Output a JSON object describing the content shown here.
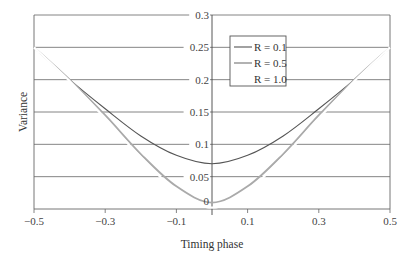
{
  "chart_data": {
    "type": "line",
    "title": "",
    "xlabel": "Timing phase",
    "ylabel": "Variance",
    "xlim": [
      -0.5,
      0.5
    ],
    "ylim": [
      0,
      0.3
    ],
    "x_ticks": [
      -0.5,
      -0.3,
      -0.1,
      0.1,
      0.3,
      0.5
    ],
    "x_tick_labels": [
      "−0.5",
      "−0.3",
      "−0.1",
      "0.1",
      "0.3",
      "0.5"
    ],
    "y_ticks": [
      0,
      0.05,
      0.1,
      0.15,
      0.2,
      0.25,
      0.3
    ],
    "y_tick_labels": [
      "0",
      "0.05",
      "0.1",
      "0.15",
      "0.2",
      "0.25",
      "0.3"
    ],
    "grid": {
      "horizontal": true,
      "vertical": false
    },
    "legend_position": "upper center-right (inside plot)",
    "x": [
      -0.5,
      -0.4,
      -0.3,
      -0.2,
      -0.1,
      0.0,
      0.1,
      0.2,
      0.3,
      0.4,
      0.5
    ],
    "series": [
      {
        "name": "R = 0.1",
        "color": "#555555",
        "values": [
          0.25,
          0.2,
          0.155,
          0.113,
          0.083,
          0.07,
          0.083,
          0.113,
          0.155,
          0.2,
          0.25
        ]
      },
      {
        "name": "R = 0.5",
        "color": "#aaaaaa",
        "values": [
          0.25,
          0.2,
          0.145,
          0.085,
          0.035,
          0.01,
          0.035,
          0.085,
          0.145,
          0.2,
          0.25
        ]
      },
      {
        "name": "R = 1.0",
        "color": "#ffffff",
        "values": [
          0.25,
          0.198,
          0.14,
          0.08,
          0.028,
          0.002,
          0.028,
          0.08,
          0.14,
          0.198,
          0.25
        ]
      }
    ]
  }
}
